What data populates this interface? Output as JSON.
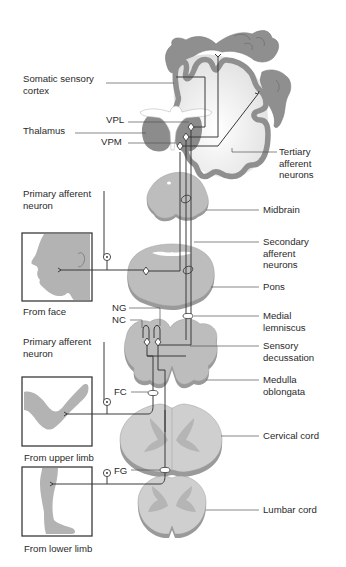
{
  "diagram": {
    "colors": {
      "cortex_gray": "#8f8f8f",
      "white_matter": "#e8e8e8",
      "structure_gray": "#bdbdbd",
      "structure_shadow": "#9a9a9a",
      "thalamus": "#8c8c8c",
      "skin": "#b3b3b3",
      "line": "#3a3a3a",
      "text": "#2a2a2a"
    },
    "labels_left": {
      "somatic_sensory_cortex": "Somatic sensory\ncortex",
      "thalamus": "Thalamus",
      "vpl": "VPL",
      "vpm": "VPM",
      "primary_afferent_neuron_1": "Primary afferent\nneuron",
      "from_face": "From face",
      "ng": "NG",
      "nc": "NC",
      "primary_afferent_neuron_2": "Primary afferent\nneuron",
      "fc": "FC",
      "from_upper_limb": "From upper limb",
      "fg": "FG",
      "from_lower_limb": "From lower limb"
    },
    "labels_right": {
      "tertiary_afferent_neurons": "Tertiary\nafferent\nneurons",
      "midbrain": "Midbrain",
      "secondary_afferent_neurons": "Secondary\nafferent\nneurons",
      "pons": "Pons",
      "medial_lemniscus": "Medial\nlemniscus",
      "sensory_decussation": "Sensory\ndecussation",
      "medulla_oblongata": "Medulla\noblongata",
      "cervical_cord": "Cervical cord",
      "lumbar_cord": "Lumbar cord"
    },
    "nodes": [
      {
        "id": "cortex",
        "label": "Somatic sensory cortex"
      },
      {
        "id": "thalamus",
        "label": "Thalamus",
        "nuclei": [
          "VPL",
          "VPM"
        ]
      },
      {
        "id": "midbrain",
        "label": "Midbrain"
      },
      {
        "id": "pons",
        "label": "Pons"
      },
      {
        "id": "medulla",
        "label": "Medulla oblongata",
        "nuclei": [
          "NG",
          "NC"
        ]
      },
      {
        "id": "cervical",
        "label": "Cervical cord",
        "tract": "FC"
      },
      {
        "id": "lumbar",
        "label": "Lumbar cord",
        "tract": "FG"
      }
    ],
    "inputs": [
      {
        "id": "face",
        "label": "From face",
        "enters": "pons"
      },
      {
        "id": "upper_limb",
        "label": "From upper limb",
        "enters": "cervical"
      },
      {
        "id": "lower_limb",
        "label": "From lower limb",
        "enters": "lumbar"
      }
    ]
  }
}
